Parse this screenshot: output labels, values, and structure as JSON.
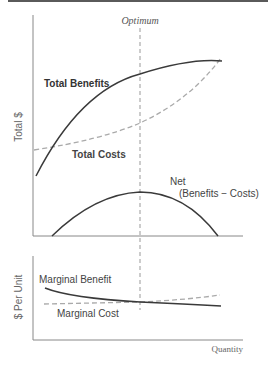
{
  "top_panel": {
    "optimum_label": "Optimum",
    "y_axis_label": "Total $",
    "total_benefits_label": "Total Benefits",
    "total_costs_label": "Total Costs",
    "net_label_line1": "Net",
    "net_label_line2": "(Benefits − Costs)"
  },
  "bottom_panel": {
    "y_axis_label": "$ Per Unit",
    "marginal_benefit_label": "Marginal Benefit",
    "marginal_cost_label": "Marginal Cost",
    "x_axis_label": "Quantity"
  },
  "colors": {
    "solid_curve": "#3a3a3a",
    "dashed_curve": "#aaaaaa",
    "axis": "#888888",
    "optimum_line": "#999999"
  }
}
